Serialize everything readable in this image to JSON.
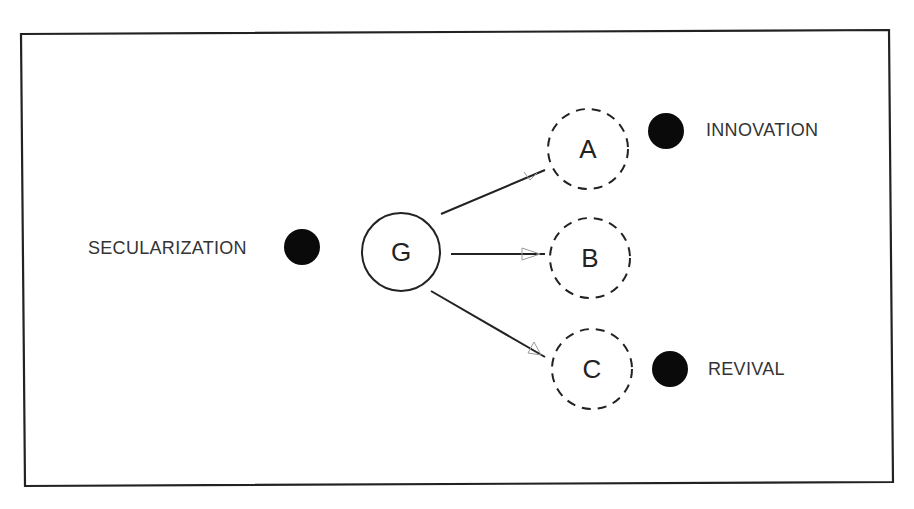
{
  "diagram": {
    "frame": {
      "corners": [
        [
          21,
          34
        ],
        [
          889,
          30
        ],
        [
          893,
          482
        ],
        [
          25,
          486
        ]
      ],
      "stroke": "#222222"
    },
    "source_node": {
      "id": "G",
      "label": "G",
      "cx": 401,
      "cy": 252,
      "r": 39,
      "style": "solid"
    },
    "target_nodes": [
      {
        "id": "A",
        "label": "A",
        "cx": 588,
        "cy": 149,
        "r": 40,
        "style": "dashed"
      },
      {
        "id": "B",
        "label": "B",
        "cx": 590,
        "cy": 258,
        "r": 40,
        "style": "dashed"
      },
      {
        "id": "C",
        "label": "C",
        "cx": 592,
        "cy": 369,
        "r": 40,
        "style": "dashed"
      }
    ],
    "edges": [
      {
        "from": "G",
        "to": "A",
        "x1": 441,
        "y1": 214,
        "x2": 545,
        "y2": 170
      },
      {
        "from": "G",
        "to": "B",
        "x1": 451,
        "y1": 254,
        "x2": 545,
        "y2": 254
      },
      {
        "from": "G",
        "to": "C",
        "x1": 431,
        "y1": 291,
        "x2": 545,
        "y2": 357
      }
    ],
    "labels": [
      {
        "id": "secularization",
        "text": "SECULARIZATION",
        "x": 88,
        "y": 254,
        "dot_cx": 302,
        "dot_cy": 247,
        "dot_r": 18
      },
      {
        "id": "innovation",
        "text": "INNOVATION",
        "x": 706,
        "y": 136,
        "dot_cx": 666,
        "dot_cy": 131,
        "dot_r": 18
      },
      {
        "id": "revival",
        "text": "REVIVAL",
        "x": 708,
        "y": 375,
        "dot_cx": 670,
        "dot_cy": 369,
        "dot_r": 18
      }
    ],
    "colors": {
      "ink": "#222222",
      "dot": "#0a0a0a",
      "text": "#333333",
      "arrowhead": "#9a9a9a"
    }
  }
}
